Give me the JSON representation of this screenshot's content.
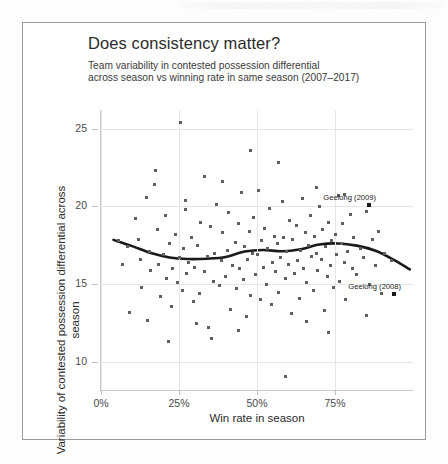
{
  "figure": {
    "title": "Does consistency matter?",
    "subtitle_line1": "Team variability in contested possession differential",
    "subtitle_line2": "across season vs winning rate in same season (2007–2017)"
  },
  "chart_data": {
    "type": "scatter",
    "title": "Does consistency matter?",
    "subtitle": "Team variability in contested possession differential across season vs winning rate in same season (2007–2017)",
    "xlabel": "Win rate in season",
    "ylabel": "Variability of contested possession differential across season",
    "xlim": [
      0,
      100
    ],
    "ylim": [
      8.2,
      26.2
    ],
    "xticks": [
      0,
      25,
      50,
      75
    ],
    "xticklabels": [
      "0%",
      "25%",
      "50%",
      "75%"
    ],
    "yticks": [
      10,
      15,
      20,
      25
    ],
    "yticklabels": [
      "10",
      "15",
      "20",
      "25"
    ],
    "grid": true,
    "legend": "none",
    "point_color": "#5f5f5f",
    "highlight_color": "#1a1a1a",
    "trend_color": "#1a1a1a",
    "series": [
      {
        "name": "Team seasons",
        "points": [
          [
            5.5,
            17.8
          ],
          [
            7.0,
            16.3
          ],
          [
            8.5,
            17.4
          ],
          [
            9.0,
            13.2
          ],
          [
            11.0,
            19.2
          ],
          [
            12.0,
            17.9
          ],
          [
            12.5,
            16.6
          ],
          [
            13.0,
            14.8
          ],
          [
            14.5,
            20.6
          ],
          [
            15.0,
            12.7
          ],
          [
            15.5,
            17.1
          ],
          [
            16.0,
            15.9
          ],
          [
            17.0,
            21.4
          ],
          [
            18.0,
            18.5
          ],
          [
            18.5,
            16.3
          ],
          [
            19.0,
            14.2
          ],
          [
            20.0,
            16.9
          ],
          [
            20.5,
            19.4
          ],
          [
            21.0,
            15.4
          ],
          [
            22.0,
            17.6
          ],
          [
            22.5,
            13.6
          ],
          [
            23.0,
            16.0
          ],
          [
            24.0,
            18.2
          ],
          [
            24.5,
            15.1
          ],
          [
            25.0,
            16.7
          ],
          [
            25.5,
            25.4
          ],
          [
            26.0,
            14.6
          ],
          [
            26.5,
            17.3
          ],
          [
            27.0,
            19.8
          ],
          [
            27.5,
            15.7
          ],
          [
            28.0,
            16.4
          ],
          [
            29.0,
            18.0
          ],
          [
            29.5,
            13.9
          ],
          [
            30.0,
            16.1
          ],
          [
            31.0,
            17.5
          ],
          [
            31.5,
            14.4
          ],
          [
            32.0,
            19.0
          ],
          [
            33.0,
            15.8
          ],
          [
            34.0,
            16.8
          ],
          [
            34.5,
            12.2
          ],
          [
            35.0,
            18.7
          ],
          [
            36.0,
            15.2
          ],
          [
            36.5,
            17.0
          ],
          [
            37.0,
            20.1
          ],
          [
            38.0,
            14.9
          ],
          [
            38.5,
            16.5
          ],
          [
            39.0,
            18.3
          ],
          [
            40.0,
            15.5
          ],
          [
            40.5,
            17.2
          ],
          [
            41.0,
            19.6
          ],
          [
            41.5,
            13.4
          ],
          [
            42.0,
            16.2
          ],
          [
            43.0,
            17.7
          ],
          [
            43.5,
            14.7
          ],
          [
            44.0,
            18.9
          ],
          [
            44.5,
            16.0
          ],
          [
            45.0,
            20.9
          ],
          [
            45.5,
            15.3
          ],
          [
            46.0,
            17.4
          ],
          [
            46.5,
            12.9
          ],
          [
            47.0,
            16.6
          ],
          [
            47.5,
            18.4
          ],
          [
            48.0,
            14.3
          ],
          [
            48.5,
            17.0
          ],
          [
            49.0,
            19.3
          ],
          [
            49.5,
            15.6
          ],
          [
            50.0,
            16.9
          ],
          [
            50.5,
            21.0
          ],
          [
            51.0,
            14.0
          ],
          [
            51.5,
            17.8
          ],
          [
            52.0,
            16.1
          ],
          [
            52.5,
            18.6
          ],
          [
            53.0,
            15.0
          ],
          [
            53.5,
            17.3
          ],
          [
            54.0,
            19.9
          ],
          [
            54.5,
            13.7
          ],
          [
            55.0,
            16.4
          ],
          [
            55.5,
            18.1
          ],
          [
            56.0,
            15.8
          ],
          [
            56.5,
            17.6
          ],
          [
            57.0,
            14.5
          ],
          [
            57.5,
            16.7
          ],
          [
            58.0,
            20.3
          ],
          [
            58.5,
            18.0
          ],
          [
            59.0,
            15.4
          ],
          [
            59.5,
            17.1
          ],
          [
            60.0,
            16.3
          ],
          [
            60.5,
            19.1
          ],
          [
            61.0,
            13.1
          ],
          [
            61.5,
            17.9
          ],
          [
            62.0,
            15.7
          ],
          [
            62.5,
            18.8
          ],
          [
            63.0,
            16.5
          ],
          [
            63.5,
            14.1
          ],
          [
            64.0,
            17.2
          ],
          [
            64.5,
            20.5
          ],
          [
            65.0,
            16.0
          ],
          [
            65.5,
            18.3
          ],
          [
            66.0,
            15.1
          ],
          [
            66.5,
            17.5
          ],
          [
            67.0,
            19.4
          ],
          [
            67.5,
            16.8
          ],
          [
            68.0,
            14.6
          ],
          [
            68.5,
            18.1
          ],
          [
            69.0,
            17.0
          ],
          [
            69.5,
            15.9
          ],
          [
            70.0,
            20.0
          ],
          [
            70.5,
            16.6
          ],
          [
            71.0,
            18.5
          ],
          [
            71.5,
            13.3
          ],
          [
            72.0,
            17.4
          ],
          [
            72.5,
            15.5
          ],
          [
            73.0,
            19.0
          ],
          [
            73.5,
            16.2
          ],
          [
            74.0,
            17.8
          ],
          [
            74.5,
            14.8
          ],
          [
            75.0,
            18.2
          ],
          [
            75.5,
            16.9
          ],
          [
            76.0,
            20.7
          ],
          [
            76.5,
            15.2
          ],
          [
            77.0,
            17.6
          ],
          [
            77.5,
            18.9
          ],
          [
            78.0,
            16.4
          ],
          [
            78.5,
            14.0
          ],
          [
            79.0,
            17.1
          ],
          [
            80.0,
            19.5
          ],
          [
            80.5,
            16.0
          ],
          [
            81.0,
            18.0
          ],
          [
            82.0,
            15.6
          ],
          [
            83.0,
            17.3
          ],
          [
            84.0,
            16.7
          ],
          [
            85.0,
            19.7
          ],
          [
            86.0,
            15.0
          ],
          [
            87.0,
            17.9
          ],
          [
            88.0,
            16.2
          ],
          [
            89.0,
            18.4
          ],
          [
            90.0,
            14.4
          ],
          [
            91.0,
            17.0
          ],
          [
            93.0,
            16.5
          ],
          [
            59.0,
            9.1
          ],
          [
            35.5,
            11.5
          ],
          [
            21.5,
            11.3
          ],
          [
            73.0,
            11.9
          ],
          [
            30.5,
            12.5
          ],
          [
            44.0,
            12.0
          ],
          [
            85.0,
            13.0
          ],
          [
            66.0,
            12.6
          ],
          [
            17.5,
            22.3
          ],
          [
            33.0,
            21.9
          ],
          [
            57.0,
            22.8
          ],
          [
            48.0,
            23.6
          ],
          [
            39.0,
            21.6
          ],
          [
            69.0,
            21.2
          ],
          [
            78.0,
            20.8
          ],
          [
            27.0,
            20.4
          ]
        ]
      }
    ],
    "highlight_points": [
      {
        "label": "Geelong (2009)",
        "x": 86.0,
        "y": 20.1
      },
      {
        "label": "Geelong (2008)",
        "x": 94.0,
        "y": 14.4
      }
    ],
    "trend": {
      "name": "LOESS smoother",
      "x": [
        4,
        10,
        16,
        22,
        28,
        34,
        40,
        46,
        52,
        58,
        64,
        70,
        76,
        82,
        88,
        94,
        99
      ],
      "y": [
        17.85,
        17.45,
        17.0,
        16.72,
        16.62,
        16.64,
        16.75,
        17.1,
        17.2,
        17.12,
        17.25,
        17.55,
        17.62,
        17.48,
        17.15,
        16.55,
        15.95
      ]
    }
  }
}
